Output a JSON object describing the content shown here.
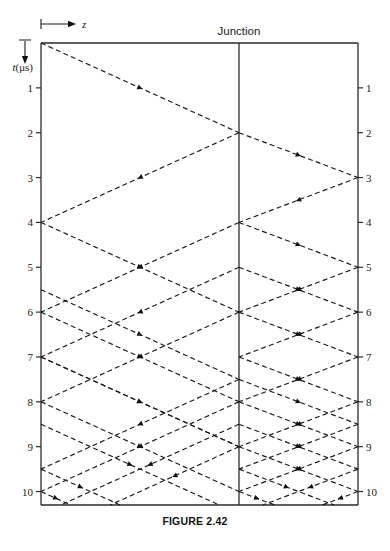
{
  "figure": {
    "caption": "FIGURE 2.42",
    "junction_label": "Junction",
    "time_axis_label": "t(μs)",
    "z_axis_label": "z"
  },
  "axes": {
    "left_ticks": [
      "1",
      "2",
      "3",
      "4",
      "5",
      "6",
      "7",
      "8",
      "9",
      "10"
    ],
    "right_ticks": [
      "1",
      "2",
      "3",
      "4",
      "5",
      "6",
      "7",
      "8",
      "9",
      "10"
    ]
  },
  "chart_data": {
    "type": "line",
    "title": "FIGURE 2.42",
    "xlabel": "z",
    "ylabel": "t(μs)",
    "ylim": [
      0,
      10.3
    ],
    "grid": false,
    "legend": "none",
    "annotations": [
      "Junction"
    ],
    "geometry": {
      "plot_left": 41,
      "plot_right": 358,
      "plot_top": 43,
      "plot_bottom": 505,
      "junction_x": 239,
      "t_min": 0,
      "t_max": 10.3,
      "left_transit_us": 2,
      "right_transit_us": 1,
      "tick_values": [
        1,
        2,
        3,
        4,
        5,
        6,
        7,
        8,
        9,
        10
      ]
    },
    "segments": [
      {
        "x0": 0.0,
        "t0": 0.0,
        "x1": 1.0,
        "t1": 2.0,
        "dir": "right",
        "section": "left"
      },
      {
        "x0": 1.0,
        "t0": 2.0,
        "x1": 0.0,
        "t1": 4.0,
        "dir": "left",
        "section": "left"
      },
      {
        "x0": 1.0,
        "t0": 2.0,
        "x1": 2.0,
        "t1": 3.0,
        "dir": "right",
        "section": "right"
      },
      {
        "x0": 2.0,
        "t0": 3.0,
        "x1": 1.0,
        "t1": 4.0,
        "dir": "left",
        "section": "right"
      },
      {
        "x0": 0.0,
        "t0": 4.0,
        "x1": 1.0,
        "t1": 6.0,
        "dir": "right",
        "section": "left"
      },
      {
        "x0": 1.0,
        "t0": 4.0,
        "x1": 0.0,
        "t1": 6.0,
        "dir": "left",
        "section": "left"
      },
      {
        "x0": 1.0,
        "t0": 4.0,
        "x1": 2.0,
        "t1": 5.0,
        "dir": "right",
        "section": "right"
      },
      {
        "x0": 2.0,
        "t0": 5.0,
        "x1": 1.0,
        "t1": 6.0,
        "dir": "left",
        "section": "right"
      },
      {
        "x0": 1.0,
        "t0": 6.0,
        "x1": 0.0,
        "t1": 8.0,
        "dir": "left",
        "section": "left"
      },
      {
        "x0": 1.0,
        "t0": 6.0,
        "x1": 2.0,
        "t1": 7.0,
        "dir": "right",
        "section": "right"
      },
      {
        "x0": 2.0,
        "t0": 7.0,
        "x1": 1.0,
        "t1": 8.0,
        "dir": "left",
        "section": "right"
      },
      {
        "x0": 0.0,
        "t0": 5.5,
        "x1": 1.0,
        "t1": 7.5,
        "dir": "right",
        "section": "left"
      },
      {
        "x0": 1.0,
        "t0": 7.5,
        "x1": 0.0,
        "t1": 9.5,
        "dir": "left",
        "section": "left"
      },
      {
        "x0": 1.0,
        "t0": 7.5,
        "x1": 2.0,
        "t1": 8.5,
        "dir": "right",
        "section": "right"
      },
      {
        "x0": 2.0,
        "t0": 8.5,
        "x1": 1.0,
        "t1": 9.5,
        "dir": "left",
        "section": "right"
      },
      {
        "x0": 0.0,
        "t0": 6.0,
        "x1": 1.0,
        "t1": 8.0,
        "dir": "right",
        "section": "left"
      },
      {
        "x0": 1.0,
        "t0": 8.0,
        "x1": 0.0,
        "t1": 10.0,
        "dir": "left",
        "section": "left"
      },
      {
        "x0": 1.0,
        "t0": 8.0,
        "x1": 2.0,
        "t1": 9.0,
        "dir": "right",
        "section": "right"
      },
      {
        "x0": 2.0,
        "t0": 9.0,
        "x1": 1.0,
        "t1": 10.0,
        "dir": "left",
        "section": "right"
      },
      {
        "x0": 0.0,
        "t0": 8.0,
        "x1": 1.0,
        "t1": 10.0,
        "dir": "right",
        "section": "left"
      },
      {
        "x0": 1.0,
        "t0": 10.0,
        "x1": 2.0,
        "t1": 11.0,
        "dir": "right",
        "section": "right"
      },
      {
        "x0": 0.0,
        "t0": 8.5,
        "x1": 1.0,
        "t1": 10.5,
        "dir": "right",
        "section": "left"
      },
      {
        "x0": 1.0,
        "t0": 8.5,
        "x1": 0.0,
        "t1": 10.5,
        "dir": "left",
        "section": "left"
      },
      {
        "x0": 1.0,
        "t0": 8.5,
        "x1": 2.0,
        "t1": 9.5,
        "dir": "right",
        "section": "right"
      },
      {
        "x0": 2.0,
        "t0": 9.5,
        "x1": 1.0,
        "t1": 10.5,
        "dir": "left",
        "section": "right"
      },
      {
        "x0": 1.0,
        "t0": 9.0,
        "x1": 0.0,
        "t1": 11.0,
        "dir": "left",
        "section": "left"
      },
      {
        "x0": 1.0,
        "t0": 9.0,
        "x1": 2.0,
        "t1": 10.0,
        "dir": "right",
        "section": "right"
      },
      {
        "x0": 2.0,
        "t0": 10.0,
        "x1": 1.0,
        "t1": 11.0,
        "dir": "left",
        "section": "right"
      },
      {
        "x0": 0.0,
        "t0": 7.0,
        "x1": 1.0,
        "t1": 9.0,
        "dir": "right",
        "section": "left"
      },
      {
        "x0": 1.0,
        "t0": 5.0,
        "x1": 0.0,
        "t1": 7.0,
        "dir": "left",
        "section": "left"
      },
      {
        "x0": 1.0,
        "t0": 5.0,
        "x1": 2.0,
        "t1": 6.0,
        "dir": "right",
        "section": "right"
      },
      {
        "x0": 2.0,
        "t0": 6.0,
        "x1": 1.0,
        "t1": 7.0,
        "dir": "left",
        "section": "right"
      },
      {
        "x0": 0.0,
        "t0": 7.0,
        "x1": 1.0,
        "t1": 9.0,
        "dir": "right",
        "section": "left"
      },
      {
        "x0": 1.0,
        "t0": 7.0,
        "x1": 2.0,
        "t1": 8.0,
        "dir": "right",
        "section": "right"
      },
      {
        "x0": 2.0,
        "t0": 8.0,
        "x1": 1.0,
        "t1": 9.0,
        "dir": "left",
        "section": "right"
      },
      {
        "x0": 1.0,
        "t0": 9.5,
        "x1": 2.0,
        "t1": 10.5,
        "dir": "right",
        "section": "right"
      },
      {
        "x0": 2.0,
        "t0": 10.5,
        "x1": 1.5,
        "t1": 11.0,
        "dir": "left",
        "section": "right"
      },
      {
        "x0": 0.0,
        "t0": 9.5,
        "x1": 1.0,
        "t1": 11.5,
        "dir": "right",
        "section": "left"
      },
      {
        "x0": 0.0,
        "t0": 10.0,
        "x1": 0.6,
        "t1": 11.2,
        "dir": "right",
        "section": "left"
      }
    ]
  }
}
